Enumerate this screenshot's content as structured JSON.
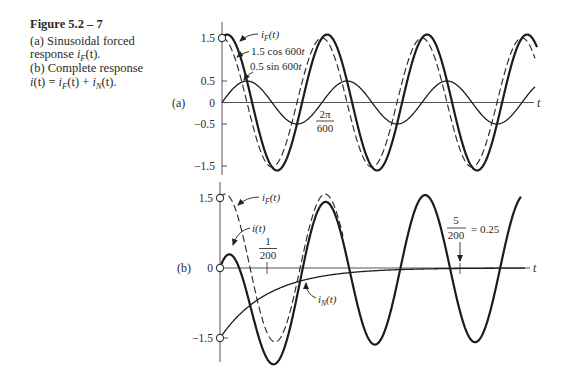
{
  "caption": {
    "title": "Figure 5.2 – 7",
    "line1": "(a) Sinusoidal forced",
    "line2": "response ",
    "line2_sym": [
      "i",
      "F",
      "(t)."
    ],
    "line3": "(b) Complete response",
    "line4": [
      "i",
      "(t) = ",
      "i",
      "F",
      "(t) + ",
      "i",
      "N",
      "(t)."
    ]
  },
  "chart_data": [
    {
      "type": "line",
      "panel": "(a)",
      "title": "Sinusoidal forced response i_F(t)",
      "xlabel": "t",
      "ylabel": "",
      "omega": 600,
      "ylim": [
        -1.6,
        1.6
      ],
      "grid": false,
      "yticks": [
        "1.5",
        "0.5",
        "0",
        "−0.5",
        "−1.5"
      ],
      "ytick_values": [
        1.5,
        0.5,
        0,
        -0.5,
        -1.5
      ],
      "series": [
        {
          "name": "i_F(t)",
          "expr": "1.5 cos 600t + 0.5 sin 600t",
          "cos_amp": 1.5,
          "sin_amp": 0.5,
          "exp_amp": 0,
          "exp_rate": 0,
          "style": "solid-thick",
          "t_end_periods": 3.15,
          "label": [
            "i",
            "F",
            "(t)"
          ]
        },
        {
          "name": "1.5 cos 600t",
          "expr": "1.5 cos 600t",
          "cos_amp": 1.5,
          "sin_amp": 0,
          "exp_amp": 0,
          "exp_rate": 0,
          "style": "dashed",
          "t_end_periods": 3.13,
          "label": [
            "1.5 cos 600",
            "t"
          ]
        },
        {
          "name": "0.5 sin 600t",
          "expr": "0.5 sin 600t",
          "cos_amp": 0,
          "sin_amp": 0.5,
          "exp_amp": 0,
          "exp_rate": 0,
          "style": "solid-thin",
          "t_end_periods": 3.13,
          "label": [
            "0.5 sin 600",
            "t"
          ]
        }
      ],
      "annotations": [
        {
          "text": "2π/600",
          "num": "2π",
          "den": "600",
          "meaning": "period of the sinusoid"
        }
      ],
      "markers": [
        {
          "t": 0,
          "value": 1.5,
          "shape": "open-circle"
        }
      ]
    },
    {
      "type": "line",
      "panel": "(b)",
      "title": "Complete response i(t) = i_F(t) + i_N(t)",
      "xlabel": "t",
      "ylabel": "",
      "omega": 600,
      "ylim": [
        -2.1,
        1.6
      ],
      "grid": false,
      "yticks": [
        "1.5",
        "0",
        "−1.5"
      ],
      "ytick_values": [
        1.5,
        0,
        -1.5
      ],
      "xticks": [
        {
          "value": 0.005,
          "label": "1/200",
          "num": "1",
          "den": "200"
        },
        {
          "value": 0.025,
          "label": "5/200 = 0.25",
          "num": "5",
          "den": "200",
          "suffix": "= 0.25"
        }
      ],
      "series": [
        {
          "name": "i_F(t)",
          "expr": "1.5 cos 600t + 0.5 sin 600t",
          "cos_amp": 1.5,
          "sin_amp": 0.5,
          "exp_amp": 0,
          "exp_rate": 0,
          "style": "dashed",
          "t_end_periods": 1.23,
          "label": [
            "i",
            "F",
            "(t)"
          ]
        },
        {
          "name": "i(t)",
          "expr": "1.5 cos 600t + 0.5 sin 600t − 1.5 e^(−200t)",
          "cos_amp": 1.5,
          "sin_amp": 0.5,
          "exp_amp": -1.5,
          "exp_rate": 200,
          "style": "solid-thick",
          "t_end_periods": 3.01,
          "label": [
            "i",
            "(t)"
          ]
        },
        {
          "name": "i_N(t)",
          "expr": "−1.5 e^(−200t)",
          "cos_amp": 0,
          "sin_amp": 0,
          "exp_amp": -1.5,
          "exp_rate": 200,
          "style": "solid-thin",
          "t_end_periods": 3.05,
          "label": [
            "i",
            "N",
            "(t)"
          ]
        }
      ],
      "markers": [
        {
          "t": 0,
          "value": 1.5,
          "shape": "open-circle"
        },
        {
          "t": 0,
          "value": 0,
          "shape": "open-circle"
        },
        {
          "t": 0,
          "value": -1.5,
          "shape": "open-circle"
        }
      ]
    }
  ]
}
